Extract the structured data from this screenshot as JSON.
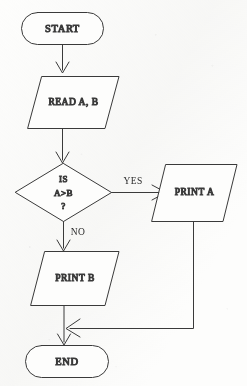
{
  "diagram": {
    "type": "flowchart",
    "canvas": {
      "width": 247,
      "height": 386
    },
    "style": {
      "background_color": "#fdfdfc",
      "stroke_color": "#3a3a3a",
      "text_color": "#2b2b2b",
      "stroke_width": 1,
      "arrowhead_style": "open-v"
    },
    "nodes": [
      {
        "id": "start",
        "shape": "terminator",
        "label": "START",
        "font_size": 10.5,
        "letter_spacing": 0.6,
        "box": {
          "x": 21,
          "y": 12,
          "width": 83,
          "height": 33
        }
      },
      {
        "id": "read",
        "shape": "parallelogram",
        "label": "READ A, B",
        "font_size": 9.5,
        "letter_spacing": 0.5,
        "box": {
          "x": 28,
          "y": 76,
          "width": 91,
          "height": 53
        },
        "skew": 16
      },
      {
        "id": "decision",
        "shape": "diamond",
        "label_lines": [
          "IS",
          "A>B",
          "?"
        ],
        "font_size": 9,
        "letter_spacing": 0.4,
        "box": {
          "x": 15,
          "y": 163,
          "width": 97,
          "height": 59
        }
      },
      {
        "id": "print_a",
        "shape": "parallelogram",
        "label": "PRINT A",
        "font_size": 9.5,
        "letter_spacing": 0.5,
        "box": {
          "x": 152,
          "y": 164,
          "width": 85,
          "height": 58
        },
        "skew": 16
      },
      {
        "id": "print_b",
        "shape": "parallelogram",
        "label": "PRINT B",
        "font_size": 9.5,
        "letter_spacing": 0.5,
        "box": {
          "x": 31,
          "y": 251,
          "width": 88,
          "height": 55
        },
        "skew": 16
      },
      {
        "id": "end",
        "shape": "terminator",
        "label": "END",
        "font_size": 10.5,
        "letter_spacing": 0.6,
        "box": {
          "x": 25,
          "y": 345,
          "width": 84,
          "height": 33
        }
      }
    ],
    "edges": [
      {
        "id": "e-start-read",
        "from": "start",
        "to": "read",
        "label": "",
        "label_pos": null
      },
      {
        "id": "e-read-decision",
        "from": "read",
        "to": "decision",
        "label": "",
        "label_pos": null
      },
      {
        "id": "e-decision-printa",
        "from": "decision",
        "to": "print_a",
        "label": "YES",
        "label_pos": {
          "x": 133,
          "y": 182
        }
      },
      {
        "id": "e-decision-printb",
        "from": "decision",
        "to": "print_b",
        "label": "NO",
        "label_pos": {
          "x": 78,
          "y": 233
        }
      },
      {
        "id": "e-printb-end",
        "from": "print_b",
        "to": "end",
        "label": "",
        "label_pos": null
      },
      {
        "id": "e-printa-end",
        "from": "print_a",
        "to": "end",
        "label": "",
        "label_pos": null
      }
    ]
  }
}
